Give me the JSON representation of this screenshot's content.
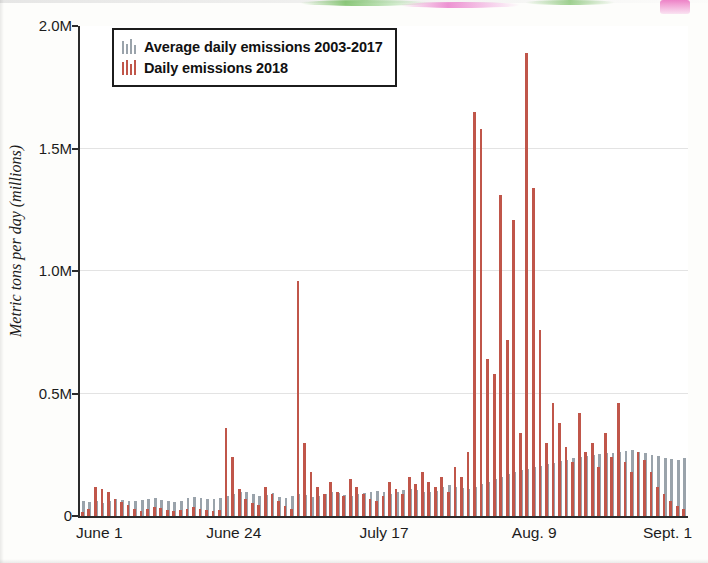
{
  "chart_data": {
    "type": "bar",
    "title": "",
    "subtitle": "",
    "xlabel": "",
    "ylabel": "Metric tons per day (millions)",
    "ylim": [
      0,
      2000000
    ],
    "yticks": [
      0,
      500000,
      1000000,
      1500000,
      2000000
    ],
    "ytick_labels": [
      "0",
      "0.5M",
      "1.0M",
      "1.5M",
      "2.0M"
    ],
    "xticks": [
      0,
      23,
      46,
      69,
      92
    ],
    "xtick_labels": [
      "June 1",
      "June 24",
      "July 17",
      "Aug. 9",
      "Sept. 1"
    ],
    "grid": "horizontal",
    "legend_position": "top-left",
    "legend": [
      {
        "name": "Average daily emissions 2003-2017",
        "color": "#9aa3ab"
      },
      {
        "name": "Daily emissions 2018",
        "color": "#c0564a"
      }
    ],
    "x_start_label": "June 1",
    "x_end_label": "Sept. 1",
    "n_points": 93,
    "series": [
      {
        "name": "Average daily emissions 2003-2017",
        "color": "#9aa3ab",
        "values": [
          60000,
          58000,
          62000,
          55000,
          60000,
          70000,
          66000,
          62000,
          60000,
          64000,
          70000,
          72000,
          66000,
          60000,
          58000,
          62000,
          74000,
          78000,
          72000,
          70000,
          68000,
          74000,
          80000,
          90000,
          96000,
          100000,
          88000,
          82000,
          86000,
          92000,
          78000,
          72000,
          80000,
          88000,
          84000,
          78000,
          82000,
          90000,
          96000,
          92000,
          86000,
          80000,
          88000,
          94000,
          100000,
          104000,
          96000,
          90000,
          98000,
          106000,
          112000,
          108000,
          100000,
          96000,
          104000,
          118000,
          126000,
          120000,
          114000,
          110000,
          118000,
          130000,
          140000,
          150000,
          160000,
          170000,
          180000,
          186000,
          192000,
          200000,
          206000,
          212000,
          218000,
          224000,
          230000,
          236000,
          240000,
          244000,
          248000,
          252000,
          256000,
          258000,
          262000,
          266000,
          268000,
          262000,
          256000,
          250000,
          244000,
          238000,
          232000,
          228000,
          236000
        ]
      },
      {
        "name": "Daily emissions 2018",
        "color": "#c0564a",
        "values": [
          18000,
          30000,
          120000,
          112000,
          96000,
          70000,
          56000,
          44000,
          30000,
          22000,
          30000,
          38000,
          32000,
          26000,
          20000,
          24000,
          30000,
          36000,
          30000,
          24000,
          20000,
          26000,
          360000,
          240000,
          110000,
          70000,
          52000,
          44000,
          120000,
          90000,
          60000,
          40000,
          30000,
          960000,
          300000,
          180000,
          120000,
          90000,
          140000,
          100000,
          80000,
          150000,
          120000,
          90000,
          70000,
          60000,
          80000,
          140000,
          110000,
          90000,
          160000,
          130000,
          180000,
          140000,
          120000,
          160000,
          100000,
          200000,
          160000,
          260000,
          1650000,
          1580000,
          640000,
          580000,
          1310000,
          720000,
          1210000,
          340000,
          1890000,
          1340000,
          760000,
          300000,
          460000,
          380000,
          280000,
          220000,
          420000,
          260000,
          300000,
          200000,
          340000,
          240000,
          460000,
          220000,
          180000,
          260000,
          230000,
          180000,
          120000,
          90000,
          60000,
          40000,
          30000
        ]
      }
    ]
  },
  "axis": {
    "y_label": "Metric tons per day (millions)"
  }
}
